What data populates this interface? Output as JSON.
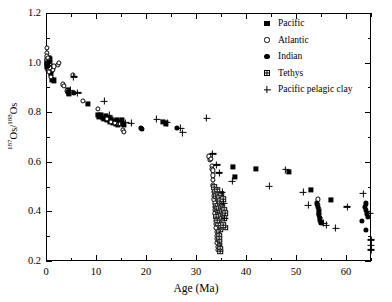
{
  "chart_data": {
    "type": "scatter",
    "title": "",
    "xlabel": "Age (Ma)",
    "ylabel": "187Os/188Os",
    "ylabel_parts": {
      "num_sup": "187",
      "num": "Os/",
      "den_sup": "188",
      "den": "Os"
    },
    "xlim": [
      0,
      65
    ],
    "ylim": [
      0.2,
      1.2
    ],
    "xticks": [
      0,
      10,
      20,
      30,
      40,
      50,
      60
    ],
    "xticks_minor": [
      5,
      15,
      25,
      35,
      45,
      55,
      65
    ],
    "yticks": [
      0.2,
      0.4,
      0.6,
      0.8,
      1.0,
      1.2
    ],
    "yticks_minor": [
      0.3,
      0.5,
      0.7,
      0.9,
      1.1
    ],
    "xtick_labels": [
      "0",
      "10",
      "20",
      "30",
      "40",
      "50",
      "60"
    ],
    "ytick_labels": [
      "0.2",
      "0.4",
      "0.6",
      "0.8",
      "1.0",
      "1.2"
    ],
    "grid": false,
    "legend_position": "top-right",
    "series": [
      {
        "name": "Pacific",
        "marker": "filled-square",
        "color": "#000000",
        "points": [
          [
            0.15,
            0.995
          ],
          [
            0.2,
            1.005
          ],
          [
            0.25,
            0.985
          ],
          [
            0.3,
            1.012
          ],
          [
            0.35,
            0.975
          ],
          [
            0.4,
            1.0
          ],
          [
            0.45,
            0.99
          ],
          [
            0.5,
            1.02
          ],
          [
            0.55,
            0.97
          ],
          [
            0.6,
            1.008
          ],
          [
            0.65,
            0.982
          ],
          [
            0.7,
            0.998
          ],
          [
            0.8,
            1.015
          ],
          [
            0.9,
            0.965
          ],
          [
            1.0,
            0.955
          ],
          [
            1.1,
            0.93
          ],
          [
            1.6,
            0.928
          ],
          [
            4.3,
            0.888
          ],
          [
            4.5,
            0.878
          ],
          [
            4.6,
            0.873
          ],
          [
            8.4,
            0.833
          ],
          [
            10.3,
            0.788
          ],
          [
            10.6,
            0.783
          ],
          [
            11.0,
            0.79
          ],
          [
            11.3,
            0.778
          ],
          [
            11.6,
            0.772
          ],
          [
            11.9,
            0.785
          ],
          [
            12.2,
            0.768
          ],
          [
            12.5,
            0.775
          ],
          [
            12.8,
            0.762
          ],
          [
            13.0,
            0.772
          ],
          [
            13.3,
            0.758
          ],
          [
            13.6,
            0.765
          ],
          [
            13.9,
            0.755
          ],
          [
            14.1,
            0.768
          ],
          [
            14.4,
            0.75
          ],
          [
            14.6,
            0.762
          ],
          [
            14.9,
            0.758
          ],
          [
            15.1,
            0.77
          ],
          [
            15.3,
            0.752
          ],
          [
            15.6,
            0.748
          ],
          [
            23.3,
            0.762
          ],
          [
            23.9,
            0.755
          ],
          [
            37.4,
            0.578
          ],
          [
            37.8,
            0.54
          ],
          [
            41.9,
            0.57
          ],
          [
            48.5,
            0.558
          ],
          [
            53.0,
            0.488
          ],
          [
            56.9,
            0.447
          ]
        ]
      },
      {
        "name": "Atlantic",
        "marker": "open-circle",
        "color": "#000000",
        "points": [
          [
            0.1,
            1.06
          ],
          [
            0.15,
            1.04
          ],
          [
            0.2,
            1.025
          ],
          [
            0.25,
            1.01
          ],
          [
            0.3,
            1.0
          ],
          [
            0.35,
            0.99
          ],
          [
            0.4,
            0.982
          ],
          [
            0.45,
            1.018
          ],
          [
            0.5,
            0.972
          ],
          [
            0.55,
            1.005
          ],
          [
            0.6,
            0.962
          ],
          [
            0.7,
            0.995
          ],
          [
            0.8,
            0.978
          ],
          [
            0.9,
            0.942
          ],
          [
            1.3,
            0.972
          ],
          [
            1.5,
            0.985
          ],
          [
            2.3,
            0.992
          ],
          [
            2.5,
            0.998
          ],
          [
            3.3,
            0.912
          ],
          [
            3.5,
            0.905
          ],
          [
            4.2,
            0.885
          ],
          [
            5.3,
            0.952
          ],
          [
            7.4,
            0.845
          ],
          [
            10.3,
            0.812
          ],
          [
            12.1,
            0.772
          ],
          [
            13.0,
            0.762
          ],
          [
            13.8,
            0.758
          ],
          [
            14.5,
            0.752
          ],
          [
            15.4,
            0.728
          ],
          [
            15.6,
            0.722
          ],
          [
            32.6,
            0.622
          ],
          [
            32.8,
            0.608
          ],
          [
            33.0,
            0.612
          ],
          [
            33.1,
            0.585
          ],
          [
            33.2,
            0.572
          ],
          [
            33.3,
            0.565
          ],
          [
            33.3,
            0.545
          ],
          [
            33.4,
            0.528
          ],
          [
            33.4,
            0.505
          ],
          [
            33.5,
            0.498
          ],
          [
            33.5,
            0.478
          ],
          [
            33.6,
            0.462
          ],
          [
            33.6,
            0.448
          ],
          [
            33.7,
            0.432
          ],
          [
            33.7,
            0.418
          ],
          [
            33.8,
            0.405
          ],
          [
            33.8,
            0.392
          ],
          [
            33.9,
            0.378
          ],
          [
            33.9,
            0.362
          ],
          [
            34.0,
            0.348
          ],
          [
            34.0,
            0.332
          ],
          [
            34.1,
            0.318
          ],
          [
            34.1,
            0.302
          ],
          [
            34.2,
            0.288
          ],
          [
            34.2,
            0.272
          ],
          [
            34.3,
            0.258
          ],
          [
            34.3,
            0.245
          ],
          [
            54.3,
            0.448
          ],
          [
            54.4,
            0.425
          ],
          [
            54.5,
            0.408
          ],
          [
            54.6,
            0.392
          ],
          [
            54.7,
            0.375
          ],
          [
            54.8,
            0.362
          ]
        ]
      },
      {
        "name": "Indian",
        "marker": "filled-circle",
        "color": "#000000",
        "points": [
          [
            0.3,
            0.998
          ],
          [
            0.45,
            0.988
          ],
          [
            0.6,
            1.002
          ],
          [
            4.4,
            0.882
          ],
          [
            5.6,
            0.878
          ],
          [
            18.9,
            0.738
          ],
          [
            19.2,
            0.733
          ],
          [
            26.1,
            0.738
          ],
          [
            54.2,
            0.432
          ],
          [
            54.4,
            0.418
          ],
          [
            54.5,
            0.402
          ],
          [
            54.6,
            0.388
          ],
          [
            54.7,
            0.372
          ],
          [
            54.9,
            0.358
          ],
          [
            55.0,
            0.352
          ],
          [
            63.2,
            0.362
          ],
          [
            63.8,
            0.418
          ],
          [
            63.9,
            0.432
          ],
          [
            64.0,
            0.405
          ],
          [
            64.2,
            0.392
          ],
          [
            64.4,
            0.378
          ],
          [
            64.0,
            0.325
          ]
        ]
      },
      {
        "name": "Tethys",
        "marker": "grid-square",
        "color": "#000000",
        "points": [
          [
            33.6,
            0.498
          ],
          [
            33.8,
            0.478
          ],
          [
            34.0,
            0.462
          ],
          [
            34.2,
            0.488
          ],
          [
            34.3,
            0.452
          ],
          [
            34.4,
            0.468
          ],
          [
            34.5,
            0.438
          ],
          [
            34.6,
            0.455
          ],
          [
            34.7,
            0.425
          ],
          [
            34.8,
            0.442
          ],
          [
            34.9,
            0.412
          ],
          [
            35.0,
            0.472
          ],
          [
            35.1,
            0.432
          ],
          [
            35.2,
            0.398
          ],
          [
            35.3,
            0.418
          ],
          [
            35.4,
            0.448
          ],
          [
            35.5,
            0.385
          ],
          [
            35.6,
            0.405
          ],
          [
            35.7,
            0.372
          ],
          [
            35.8,
            0.392
          ],
          [
            33.9,
            0.422
          ],
          [
            34.1,
            0.408
          ],
          [
            34.3,
            0.395
          ],
          [
            34.5,
            0.382
          ],
          [
            34.6,
            0.368
          ],
          [
            34.7,
            0.355
          ],
          [
            34.8,
            0.342
          ],
          [
            34.9,
            0.328
          ],
          [
            35.0,
            0.338
          ],
          [
            34.4,
            0.352
          ],
          [
            34.2,
            0.365
          ],
          [
            34.0,
            0.378
          ],
          [
            34.55,
            0.315
          ],
          [
            34.6,
            0.302
          ],
          [
            34.65,
            0.288
          ],
          [
            34.7,
            0.275
          ],
          [
            34.75,
            0.262
          ],
          [
            34.8,
            0.248
          ],
          [
            34.85,
            0.238
          ],
          [
            35.9,
            0.335
          ],
          [
            35.4,
            0.345
          ]
        ]
      },
      {
        "name": "Pacific pelagic clay",
        "marker": "plus",
        "color": "#000000",
        "points": [
          [
            4.9,
            0.888
          ],
          [
            5.5,
            0.942
          ],
          [
            6.3,
            0.878
          ],
          [
            11.6,
            0.845
          ],
          [
            12.6,
            0.788
          ],
          [
            14.4,
            0.762
          ],
          [
            15.9,
            0.758
          ],
          [
            17.0,
            0.755
          ],
          [
            22.1,
            0.772
          ],
          [
            24.2,
            0.758
          ],
          [
            26.9,
            0.735
          ],
          [
            27.3,
            0.718
          ],
          [
            32.1,
            0.775
          ],
          [
            33.3,
            0.632
          ],
          [
            34.1,
            0.588
          ],
          [
            34.6,
            0.555
          ],
          [
            35.2,
            0.478
          ],
          [
            35.5,
            0.432
          ],
          [
            35.7,
            0.372
          ],
          [
            37.2,
            0.522
          ],
          [
            44.6,
            0.502
          ],
          [
            47.9,
            0.568
          ],
          [
            51.4,
            0.478
          ],
          [
            52.4,
            0.425
          ],
          [
            55.5,
            0.352
          ],
          [
            56.0,
            0.345
          ],
          [
            57.9,
            0.332
          ],
          [
            60.2,
            0.418
          ],
          [
            63.4,
            0.472
          ],
          [
            64.8,
            0.392
          ],
          [
            65.0,
            0.285
          ],
          [
            65.0,
            0.245
          ],
          [
            65.0,
            0.262
          ]
        ]
      }
    ]
  },
  "legend": {
    "items": [
      {
        "label": "Pacific",
        "marker": "filled-square"
      },
      {
        "label": "Atlantic",
        "marker": "open-circle"
      },
      {
        "label": "Indian",
        "marker": "filled-circle"
      },
      {
        "label": "Tethys",
        "marker": "grid-square"
      },
      {
        "label": "Pacific pelagic clay",
        "marker": "plus"
      }
    ]
  }
}
